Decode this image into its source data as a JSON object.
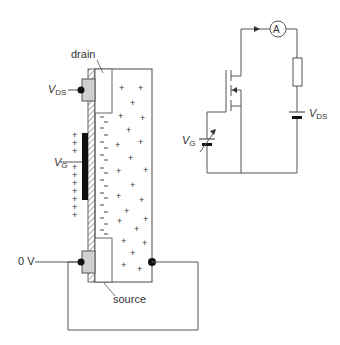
{
  "diagram": {
    "labels": {
      "drain": "drain",
      "source": "source",
      "vds_main": "V",
      "vds_sub": "DS",
      "vg_main": "V",
      "vg_sub": "G",
      "zero_volt": "0 V",
      "circuit_vg_main": "V",
      "circuit_vg_sub": "G",
      "circuit_vds_main": "V",
      "circuit_vds_sub": "DS",
      "ammeter": "A"
    },
    "symbols": {
      "positive": "+",
      "negative": "–"
    },
    "colors": {
      "line": "#555555",
      "gate": "#111111",
      "contact": "#d0d0d0",
      "text": "#333333"
    }
  }
}
